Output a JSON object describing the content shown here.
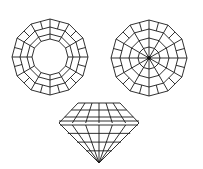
{
  "diagram": {
    "type": "gemstone-facet-views",
    "views": [
      {
        "name": "crown-top-view",
        "shape": "dodecagon",
        "center": [
          50,
          57
        ],
        "radius": 38,
        "rings": [
          38,
          30,
          23,
          18
        ],
        "spokes": 12,
        "open_table": true
      },
      {
        "name": "pavilion-bottom-view",
        "shape": "dodecagon",
        "center": [
          149,
          58
        ],
        "radius": 38,
        "rings": [
          38,
          29,
          20,
          11
        ],
        "spokes": 12,
        "culet_dot": true
      },
      {
        "name": "side-profile-view",
        "girdle_left": 59,
        "girdle_right": 139,
        "girdle_y": 123,
        "table_left": 78,
        "table_right": 120,
        "table_y": 103,
        "culet": [
          99,
          163
        ]
      }
    ],
    "stroke_color": "#1a1a1a",
    "background": "#ffffff"
  }
}
